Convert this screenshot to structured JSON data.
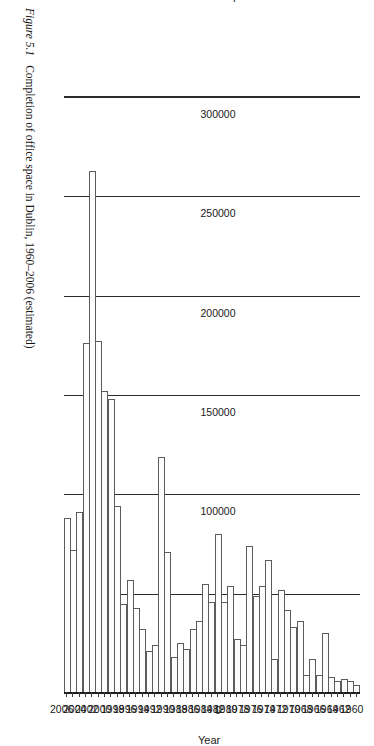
{
  "caption": {
    "figure_number": "Figure 5.1",
    "text": "Completion of office space in Dublin, 1960–2006 (estimated)"
  },
  "chart_data": {
    "type": "bar",
    "orientation": "vertical-rendered-rotated",
    "title": "",
    "xlabel": "Year",
    "ylabel": "Sq metres",
    "ylim": [
      0,
      300000
    ],
    "ytick_labels": [
      "0",
      "50000",
      "100000",
      "150000",
      "200000",
      "250000",
      "300000"
    ],
    "ytick_values": [
      0,
      50000,
      100000,
      150000,
      200000,
      250000,
      300000
    ],
    "grid": true,
    "legend": "none",
    "xtick_labels": [
      "1960",
      "1962",
      "1964",
      "1966",
      "1968",
      "1970",
      "1972",
      "1974",
      "1976",
      "1978",
      "1980",
      "1982",
      "1984",
      "1986",
      "1988",
      "1990",
      "1992",
      "1994",
      "1996",
      "1998",
      "2000",
      "2002",
      "2004",
      "2006"
    ],
    "categories": [
      "1960",
      "1961",
      "1962",
      "1963",
      "1964",
      "1965",
      "1966",
      "1967",
      "1968",
      "1969",
      "1970",
      "1971",
      "1972",
      "1973",
      "1974",
      "1975",
      "1976",
      "1977",
      "1978",
      "1979",
      "1980",
      "1981",
      "1982",
      "1983",
      "1984",
      "1985",
      "1986",
      "1987",
      "1988",
      "1989",
      "1990",
      "1991",
      "1992",
      "1993",
      "1994",
      "1995",
      "1996",
      "1997",
      "1998",
      "1999",
      "2000",
      "2001",
      "2002",
      "2003",
      "2004",
      "2005",
      "2006"
    ],
    "values": [
      4000,
      6000,
      7000,
      6000,
      8000,
      30000,
      9000,
      17000,
      9000,
      36000,
      33000,
      42000,
      52000,
      17000,
      67000,
      54000,
      49000,
      74000,
      24000,
      27000,
      54000,
      46000,
      80000,
      46000,
      55000,
      36000,
      32000,
      22000,
      25000,
      18000,
      71000,
      119000,
      24000,
      21000,
      32000,
      43000,
      57000,
      45000,
      94000,
      148000,
      152000,
      177000,
      263000,
      176000,
      91000,
      72000,
      88000
    ],
    "series_name": "Office space completed (sq metres)"
  }
}
